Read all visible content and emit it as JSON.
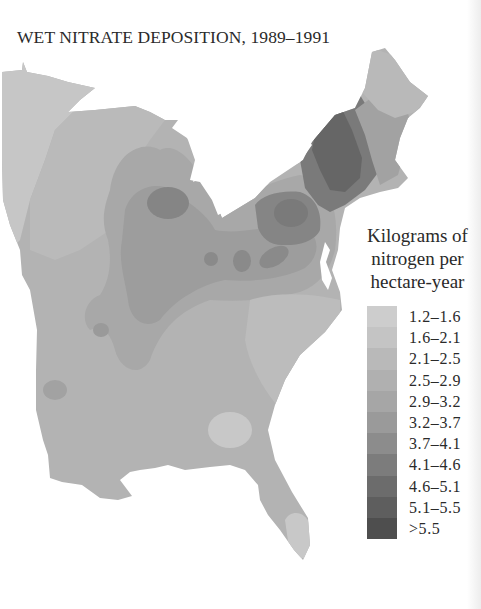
{
  "title": "WET NITRATE DEPOSITION, 1989–1991",
  "legend": {
    "title_lines": [
      "Kilograms of",
      "nitrogen per",
      "hectare-year"
    ],
    "items": [
      {
        "label": "1.2–1.6",
        "color": "#cdcdcd"
      },
      {
        "label": "1.6–2.1",
        "color": "#c4c4c4"
      },
      {
        "label": "2.1–2.5",
        "color": "#b9b9b9"
      },
      {
        "label": "2.5–2.9",
        "color": "#b0b0b0"
      },
      {
        "label": "2.9–3.2",
        "color": "#a6a6a6"
      },
      {
        "label": "3.2–3.7",
        "color": "#9a9a9a"
      },
      {
        "label": "3.7–4.1",
        "color": "#8c8c8c"
      },
      {
        "label": "4.1–4.6",
        "color": "#7c7c7c"
      },
      {
        "label": "4.6–5.1",
        "color": "#6c6c6c"
      },
      {
        "label": "5.1–5.5",
        "color": "#5e5e5e"
      },
      {
        "label": ">5.5",
        "color": "#4e4e4e"
      }
    ]
  },
  "map_regions": {
    "base_color": "#b3b3b3",
    "light_northwest": "#c6c6c6",
    "west_band": "#b9b9b9",
    "midwest_mid": "#a8a8a8",
    "ohio_valley": "#9c9c9c",
    "hotspots": "#858585",
    "new_york_core": "#6a6a6a",
    "new_england": "#a2a2a2",
    "maine": "#b8b8b8",
    "southeast_light": "#c8c8c8",
    "florida_tip": "#c8c8c8"
  }
}
